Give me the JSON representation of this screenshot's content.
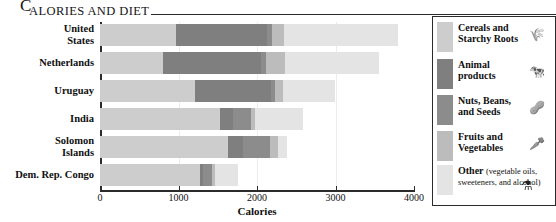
{
  "title": {
    "dropcap": "C",
    "rest": "ALORIES AND DIET"
  },
  "chart_data": {
    "type": "bar",
    "orientation": "horizontal",
    "stacked": true,
    "xlabel": "Calories",
    "ylabel": "",
    "xlim": [
      0,
      4000
    ],
    "xticks": [
      0,
      1000,
      2000,
      3000,
      4000
    ],
    "xticklabels": [
      "0",
      "1000",
      "2000",
      "3000",
      "4000"
    ],
    "grid": true,
    "legend_position": "right",
    "categories": [
      "United States",
      "Netherlands",
      "Uruguay",
      "India",
      "Solomon Islands",
      "Dem. Rep. Congo"
    ],
    "series": [
      {
        "name": "Cereals and Starchy Roots",
        "color": "#cdcdcd",
        "values": [
          970,
          800,
          1210,
          1530,
          1630,
          1275
        ]
      },
      {
        "name": "Animal products",
        "color": "#7f7f7f",
        "values": [
          1160,
          1250,
          970,
          165,
          190,
          40
        ]
      },
      {
        "name": "Nuts, Beans, and Seeds",
        "color": "#8c8c8c",
        "values": [
          60,
          65,
          50,
          230,
          345,
          115
        ]
      },
      {
        "name": "Fruits and Vegetables",
        "color": "#bcbcbc",
        "values": [
          160,
          240,
          100,
          50,
          100,
          40
        ]
      },
      {
        "name": "Other",
        "color": "#e4e4e4",
        "values": [
          1450,
          1200,
          660,
          610,
          115,
          290
        ]
      }
    ],
    "totals": [
      3800,
      3555,
      2990,
      2585,
      2380,
      1760
    ]
  },
  "legend": {
    "items": [
      {
        "label_line1": "Cereals and",
        "label_line2": "Starchy Roots",
        "sub": "",
        "color": "#cdcdcd",
        "icon": "wheat-icon",
        "glyph": "🌾"
      },
      {
        "label_line1": "Animal",
        "label_line2": "products",
        "sub": "",
        "color": "#7f7f7f",
        "icon": "cow-icon",
        "glyph": "🐄"
      },
      {
        "label_line1": "Nuts, Beans,",
        "label_line2": "and Seeds",
        "sub": "",
        "color": "#8c8c8c",
        "icon": "nut-bowl-icon",
        "glyph": "🥜"
      },
      {
        "label_line1": "Fruits and",
        "label_line2": "Vegetables",
        "sub": "",
        "color": "#bcbcbc",
        "icon": "vegetable-icon",
        "glyph": "🥕"
      },
      {
        "label_line1": "Other",
        "label_line2": "",
        "sub": "(vegetable oils, sweeteners, and alcohol)",
        "color": "#e4e4e4",
        "icon": "oil-flask-icon",
        "glyph": "⚗"
      }
    ]
  }
}
